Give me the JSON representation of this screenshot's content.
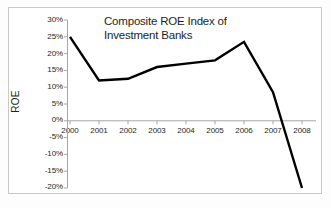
{
  "figure": {
    "background_color": "#ffffff",
    "frame_color": "#c9c9c9",
    "axis_color": "#a6a6a6",
    "line_color": "#000000",
    "text_color": "#231f20"
  },
  "axis_title_y": "ROE",
  "title_lines": [
    "Composite ROE Index of",
    "Investment Banks"
  ],
  "chart_data": {
    "type": "line",
    "title": "Composite ROE Index of Investment Banks",
    "xlabel": "",
    "ylabel": "ROE",
    "categories": [
      "2000",
      "2001",
      "2002",
      "2003",
      "2004",
      "2005",
      "2006",
      "2007",
      "2008"
    ],
    "x": [
      2000,
      2001,
      2002,
      2003,
      2004,
      2005,
      2006,
      2007,
      2008
    ],
    "values": [
      25,
      12,
      12.5,
      16,
      17,
      18,
      23.5,
      8.5,
      -20
    ],
    "value_unit": "percent",
    "series": [
      {
        "name": "Composite ROE Index of Investment Banks",
        "values": [
          25,
          12,
          12.5,
          16,
          17,
          18,
          23.5,
          8.5,
          -20
        ],
        "color": "#000000"
      }
    ],
    "ylim": [
      -20,
      30
    ],
    "yticks": [
      30,
      25,
      20,
      15,
      10,
      5,
      0,
      -5,
      -10,
      -15,
      -20
    ],
    "ytick_labels": [
      "30%",
      "25%",
      "20%",
      "15%",
      "10%",
      "5%",
      "0%",
      "-5%",
      "-10%",
      "-15%",
      "-20%"
    ],
    "xtick_labels": [
      "2000",
      "2001",
      "2002",
      "2003",
      "2004",
      "2005",
      "2006",
      "2007",
      "2008"
    ],
    "grid": false,
    "legend": false,
    "zero_line": true
  }
}
